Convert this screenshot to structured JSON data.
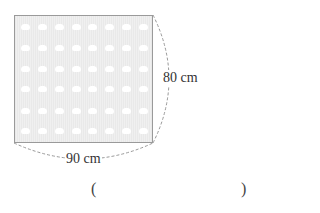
{
  "figure": {
    "shape": "square-cloth",
    "width_label": "90 cm",
    "height_label": "80 cm",
    "pattern": {
      "rows": 6,
      "columns": 8,
      "dot_color": "#ffffff",
      "fill_color": "#ededed",
      "border_color": "#9a9a9a"
    }
  },
  "answer": {
    "open_paren": "(",
    "close_paren": ")",
    "value": ""
  }
}
